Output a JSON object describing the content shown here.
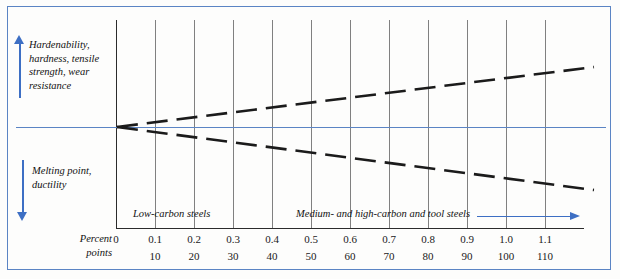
{
  "figure": {
    "frame_color": "#5b84c4",
    "baseline_color": "#5b84c4",
    "background": "#fdfdfc"
  },
  "annotations": {
    "up_label": "Hardenability, hardness, tensile strength, wear resistance",
    "down_label": "Melting point, ductility",
    "up_arrow_icon": "arrow-up-icon",
    "down_arrow_icon": "arrow-down-icon",
    "region_arrow_icon": "arrow-right-icon"
  },
  "axis_caption": {
    "line1": "Percent",
    "line2": "points"
  },
  "regions": [
    {
      "name": "low-carbon",
      "label": "Low-carbon steels"
    },
    {
      "name": "medium-high-carbon",
      "label": "Medium- and high-carbon and tool steels"
    }
  ],
  "chart_data": {
    "type": "line",
    "title": "",
    "subtitle": "",
    "xlabel": "Percent points",
    "ylabel": "",
    "grid": true,
    "legend": "none",
    "x_axis": {
      "percent_ticks": [
        "0",
        "0.1",
        "0.2",
        "0.3",
        "0.4",
        "0.5",
        "0.6",
        "0.7",
        "0.8",
        "0.9",
        "1.0",
        "1.1"
      ],
      "points_ticks": [
        "",
        "10",
        "20",
        "30",
        "40",
        "50",
        "60",
        "70",
        "80",
        "90",
        "100",
        "110"
      ],
      "xlim": [
        0,
        1.2
      ]
    },
    "y_axis": {
      "ylim": [
        -1,
        1
      ],
      "zero_label": "",
      "upper_direction": "Hardenability, hardness, tensile strength, wear resistance",
      "lower_direction": "Melting point, ductility"
    },
    "series": [
      {
        "name": "Hardenability, hardness, tensile strength, wear resistance",
        "style": "dashed",
        "color": "#1b1b1b",
        "x": [
          0,
          1.22
        ],
        "values": [
          0,
          0.575
        ]
      },
      {
        "name": "Melting point, ductility",
        "style": "dashed",
        "color": "#1b1b1b",
        "x": [
          0,
          1.22
        ],
        "values": [
          0,
          -0.605
        ]
      }
    ],
    "annotations": [
      {
        "text": "Low-carbon steels",
        "x": 0.16,
        "y": -0.86
      },
      {
        "text": "Medium- and high-carbon and tool steels",
        "x": 0.62,
        "y": -0.86
      }
    ]
  },
  "ticks": [
    {
      "percent": "0",
      "points": ""
    },
    {
      "percent": "0.1",
      "points": "10"
    },
    {
      "percent": "0.2",
      "points": "20"
    },
    {
      "percent": "0.3",
      "points": "30"
    },
    {
      "percent": "0.4",
      "points": "40"
    },
    {
      "percent": "0.5",
      "points": "50"
    },
    {
      "percent": "0.6",
      "points": "60"
    },
    {
      "percent": "0.7",
      "points": "70"
    },
    {
      "percent": "0.8",
      "points": "80"
    },
    {
      "percent": "0.9",
      "points": "90"
    },
    {
      "percent": "1.0",
      "points": "100"
    },
    {
      "percent": "1.1",
      "points": "110"
    }
  ]
}
